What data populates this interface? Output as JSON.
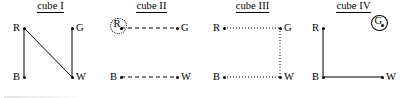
{
  "figure": {
    "background_color": "#ffffff",
    "ink_color": "#000000",
    "panels": [
      {
        "id": "cube-1",
        "title": "cube I",
        "title_underlined": true,
        "nodes": [
          {
            "id": "R",
            "label": "R",
            "x": 24,
            "y": 28,
            "label_side": "left",
            "circled": false,
            "circle_style": "none"
          },
          {
            "id": "G",
            "label": "G",
            "x": 72,
            "y": 28,
            "label_side": "right",
            "circled": false,
            "circle_style": "none"
          },
          {
            "id": "B",
            "label": "B",
            "x": 24,
            "y": 77,
            "label_side": "left",
            "circled": false,
            "circle_style": "none"
          },
          {
            "id": "W",
            "label": "W",
            "x": 72,
            "y": 77,
            "label_side": "right",
            "circled": false,
            "circle_style": "none"
          }
        ],
        "edges": [
          {
            "from": "R",
            "to": "B",
            "style": "solid"
          },
          {
            "from": "G",
            "to": "W",
            "style": "solid"
          },
          {
            "from": "R",
            "to": "W",
            "style": "solid"
          }
        ]
      },
      {
        "id": "cube-2",
        "title": "cube II",
        "title_underlined": true,
        "nodes": [
          {
            "id": "R",
            "label": "R",
            "x": 20,
            "y": 28,
            "label_side": "center",
            "circled": true,
            "circle_style": "dotted"
          },
          {
            "id": "G",
            "label": "G",
            "x": 76,
            "y": 28,
            "label_side": "right",
            "circled": false,
            "circle_style": "none"
          },
          {
            "id": "B",
            "label": "B",
            "x": 20,
            "y": 77,
            "label_side": "left",
            "circled": false,
            "circle_style": "none"
          },
          {
            "id": "W",
            "label": "W",
            "x": 76,
            "y": 77,
            "label_side": "right",
            "circled": false,
            "circle_style": "none"
          }
        ],
        "edges": [
          {
            "from": "R",
            "to": "G",
            "style": "dashed"
          },
          {
            "from": "B",
            "to": "W",
            "style": "dashed"
          }
        ]
      },
      {
        "id": "cube-3",
        "title": "cube III",
        "title_underlined": true,
        "nodes": [
          {
            "id": "R",
            "label": "R",
            "x": 22,
            "y": 28,
            "label_side": "left",
            "circled": false,
            "circle_style": "none"
          },
          {
            "id": "G",
            "label": "G",
            "x": 78,
            "y": 28,
            "label_side": "right",
            "circled": false,
            "circle_style": "none"
          },
          {
            "id": "B",
            "label": "B",
            "x": 22,
            "y": 77,
            "label_side": "left",
            "circled": false,
            "circle_style": "none"
          },
          {
            "id": "W",
            "label": "W",
            "x": 78,
            "y": 77,
            "label_side": "right",
            "circled": false,
            "circle_style": "none"
          }
        ],
        "edges": [
          {
            "from": "R",
            "to": "G",
            "style": "dotted"
          },
          {
            "from": "G",
            "to": "W",
            "style": "dotted"
          },
          {
            "from": "B",
            "to": "W",
            "style": "dotted"
          }
        ]
      },
      {
        "id": "cube-4",
        "title": "cube IV",
        "title_underlined": true,
        "nodes": [
          {
            "id": "R",
            "label": "R",
            "x": 20,
            "y": 28,
            "label_side": "left",
            "circled": false,
            "circle_style": "none"
          },
          {
            "id": "G",
            "label": "G",
            "x": 79,
            "y": 25,
            "label_side": "center",
            "circled": true,
            "circle_style": "solid"
          },
          {
            "id": "B",
            "label": "B",
            "x": 20,
            "y": 77,
            "label_side": "left",
            "circled": false,
            "circle_style": "none"
          },
          {
            "id": "W",
            "label": "W",
            "x": 79,
            "y": 77,
            "label_side": "right",
            "circled": false,
            "circle_style": "none"
          }
        ],
        "edges": [
          {
            "from": "R",
            "to": "B",
            "style": "solid"
          },
          {
            "from": "B",
            "to": "W",
            "style": "solid"
          }
        ]
      }
    ],
    "panel_layout": [
      {
        "left": 0,
        "width": 101
      },
      {
        "left": 101,
        "width": 101
      },
      {
        "left": 202,
        "width": 101
      },
      {
        "left": 303,
        "width": 101
      }
    ]
  }
}
